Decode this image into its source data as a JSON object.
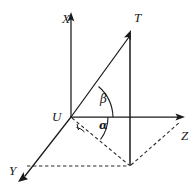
{
  "figure": {
    "type": "3d-coordinate-vector-diagram",
    "background_color": "#ffffff",
    "line_color": "#1a1a1a"
  },
  "labels": {
    "axis_x": "X",
    "axis_y": "Y",
    "axis_z": "Z",
    "origin": "U",
    "point_t": "T",
    "angle_beta": "β",
    "angle_alpha": "α"
  },
  "geometry": {
    "origin": {
      "x": 71,
      "y": 117
    },
    "x_axis_tip": {
      "x": 71,
      "y": 14
    },
    "y_axis_tip": {
      "x": 18,
      "y": 181
    },
    "z_axis_tip": {
      "x": 184,
      "y": 117
    },
    "point_t": {
      "x": 130,
      "y": 31
    },
    "projection_point": {
      "x": 130,
      "y": 166
    },
    "t_base_on_z_plane": {
      "x": 130,
      "y": 117
    },
    "dashed_z_end": {
      "x": 181,
      "y": 121
    },
    "dashed_y_end": {
      "x": 28,
      "y": 166
    }
  },
  "angles": {
    "beta": {
      "name": "β",
      "between": [
        "vector-UT",
        "axis-Z"
      ],
      "label_position": {
        "x": 104,
        "y": 95
      }
    },
    "alpha": {
      "name": "α",
      "between": [
        "projection-line",
        "axis-Z"
      ],
      "label_position": {
        "x": 100,
        "y": 121
      }
    }
  }
}
